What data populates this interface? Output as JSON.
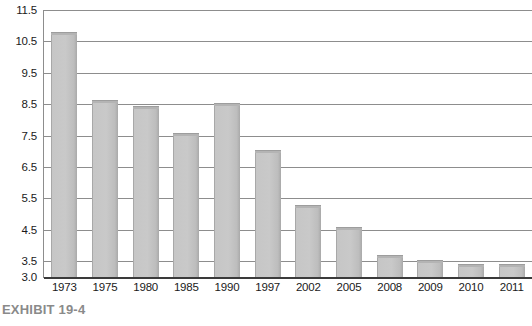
{
  "caption": "EXHIBIT 19-4",
  "chart_data": {
    "type": "bar",
    "title": "",
    "subtitle": "",
    "xlabel": "",
    "ylabel": "",
    "categories": [
      "1973",
      "1975",
      "1980",
      "1985",
      "1990",
      "1997",
      "2002",
      "2005",
      "2008",
      "2009",
      "2010",
      "2011"
    ],
    "values": [
      10.8,
      8.65,
      8.45,
      7.6,
      8.55,
      7.05,
      5.3,
      4.6,
      3.7,
      3.55,
      3.4,
      3.4
    ],
    "ylim": [
      3.0,
      11.5
    ],
    "yticks": [
      "11.5",
      "10.5",
      "9.5",
      "8.5",
      "7.5",
      "6.5",
      "5.5",
      "4.5",
      "3.5",
      "3.0"
    ],
    "ytick_values": [
      11.5,
      10.5,
      9.5,
      8.5,
      7.5,
      6.5,
      5.5,
      4.5,
      3.5,
      3.0
    ],
    "grid": true,
    "legend": false,
    "bar_color": "#c6c6c6",
    "bar_edge_color": "#a8a8a8",
    "gridline_color": "#8d8d8d",
    "axis_color": "#3a3a3a",
    "background": "#ffffff"
  }
}
